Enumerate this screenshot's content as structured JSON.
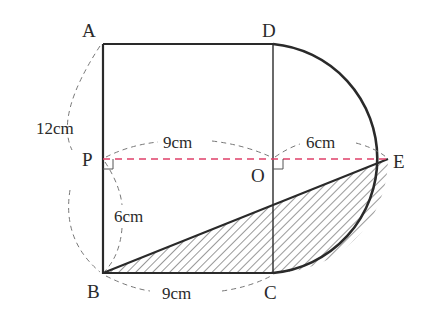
{
  "diagram": {
    "points": {
      "A": {
        "label": "A"
      },
      "B": {
        "label": "B"
      },
      "C": {
        "label": "C"
      },
      "D": {
        "label": "D"
      },
      "E": {
        "label": "E"
      },
      "O": {
        "label": "O"
      },
      "P": {
        "label": "P"
      }
    },
    "dimensions": {
      "AB": "12cm",
      "PO": "9cm",
      "OE": "6cm",
      "PB": "6cm",
      "BC": "9cm"
    },
    "colors": {
      "outline": "#2a2a2a",
      "dash_gray": "#777777",
      "dash_pink": "#e0406a",
      "hatch": "#333333"
    }
  }
}
